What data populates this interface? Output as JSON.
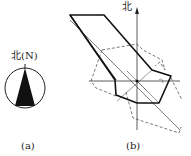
{
  "figure_a": {
    "north_label": "北(N)",
    "caption": "(a)",
    "compass": {
      "shape": "circle with filled north-pointing triangle"
    }
  },
  "figure_b": {
    "north_label": "北",
    "caption": "(b)",
    "axes": [
      "north-south vertical axis with arrow",
      "east-west horizontal axis"
    ],
    "polygons": [
      {
        "name": "solid-polygon",
        "style": "solid thick"
      },
      {
        "name": "dashed-polygon",
        "style": "dashed thin"
      }
    ]
  },
  "colors": {
    "stroke": "#222222",
    "fill": "#111111",
    "background": "#ffffff"
  }
}
